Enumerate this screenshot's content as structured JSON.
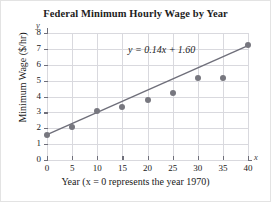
{
  "chart_data": {
    "type": "scatter",
    "title": "Federal Minimum Hourly Wage by Year",
    "xlabel": "Year (x = 0 represents the year 1970)",
    "ylabel": "Minimum Wage ($/hr)",
    "x_axis_name": "x",
    "y_axis_name": "y",
    "xlim": [
      0,
      40
    ],
    "ylim": [
      0,
      8
    ],
    "xticks": [
      0,
      5,
      10,
      15,
      20,
      25,
      30,
      35,
      40
    ],
    "yticks": [
      0,
      1,
      2,
      3,
      4,
      5,
      6,
      7,
      8
    ],
    "xtick_labels": [
      "0",
      "5",
      "10",
      "15",
      "20",
      "25",
      "30",
      "35",
      "40"
    ],
    "ytick_labels": [
      "0",
      "1",
      "2",
      "3",
      "4",
      "5",
      "6",
      "7",
      "8"
    ],
    "grid": true,
    "legend": "none",
    "x": [
      0,
      5,
      10,
      15,
      20,
      25,
      30,
      35,
      40
    ],
    "values": [
      1.6,
      2.1,
      3.1,
      3.35,
      3.8,
      4.25,
      5.15,
      5.15,
      7.25
    ],
    "annotation": "y = 0.14x + 1.60",
    "trendline": {
      "equation": "y = 0.14x + 1.60",
      "slope": 0.14,
      "intercept": 1.6,
      "x_start": 0,
      "x_end": 40,
      "y_start": 1.6,
      "y_end": 7.2
    },
    "marker_color": "#77777f",
    "line_color": "#6f6f7a",
    "grid_color": "#d9d9de",
    "axis_color": "#6f6f7a",
    "background_color": "#ffffff"
  }
}
